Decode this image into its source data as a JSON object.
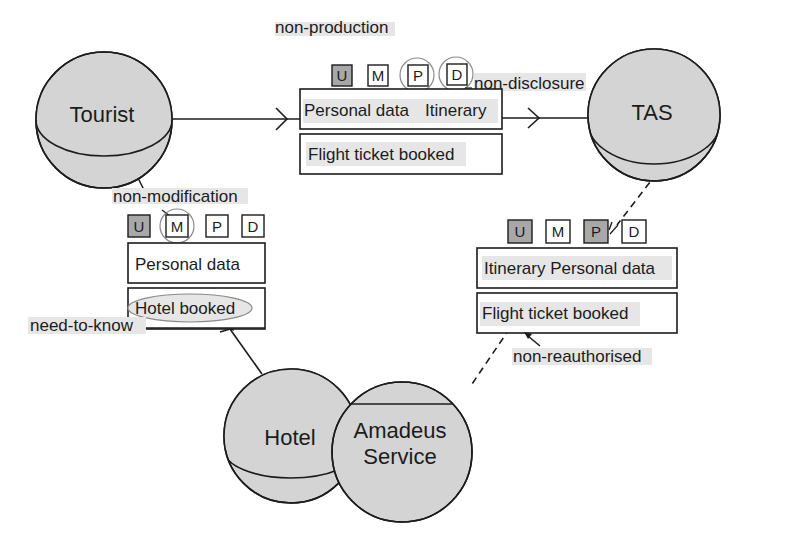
{
  "colors": {
    "sphere_fill": "#d4d4d4",
    "stroke": "#1c1c1c",
    "badge_shaded": "#a8a8a8",
    "badge_plain": "#ffffff",
    "highlight": "#e6e6e6",
    "circle_mark": "#8a8a8a"
  },
  "nodes": {
    "tourist": "Tourist",
    "tas": "TAS",
    "hotel": "Hotel",
    "amadeus_line1": "Amadeus",
    "amadeus_line2": "Service"
  },
  "messages": {
    "tourist_to_tas": {
      "badges": [
        {
          "letter": "U",
          "shaded": true,
          "circled": false
        },
        {
          "letter": "M",
          "shaded": false,
          "circled": false
        },
        {
          "letter": "P",
          "shaded": false,
          "circled": true
        },
        {
          "letter": "D",
          "shaded": false,
          "circled": true
        }
      ],
      "row1_a": "Personal data",
      "row1_b": "Itinerary",
      "row2": "Flight ticket booked"
    },
    "tourist_to_hotel": {
      "badges": [
        {
          "letter": "U",
          "shaded": true,
          "circled": false
        },
        {
          "letter": "M",
          "shaded": false,
          "circled": true
        },
        {
          "letter": "P",
          "shaded": false,
          "circled": false
        },
        {
          "letter": "D",
          "shaded": false,
          "circled": false
        }
      ],
      "row1": "Personal data",
      "row2": "Hotel booked"
    },
    "tas_to_amadeus": {
      "badges": [
        {
          "letter": "U",
          "shaded": true,
          "circled": false
        },
        {
          "letter": "M",
          "shaded": false,
          "circled": false
        },
        {
          "letter": "P",
          "shaded": true,
          "circled": false
        },
        {
          "letter": "D",
          "shaded": false,
          "circled": false
        }
      ],
      "row1": "Itinerary Personal data",
      "row2": "Flight ticket booked"
    }
  },
  "annotations": {
    "non_production": "non-production",
    "non_disclosure": "non-disclosure",
    "non_modification": "non-modification",
    "need_to_know": "need-to-know",
    "non_reauthorised": "non-reauthorised"
  }
}
